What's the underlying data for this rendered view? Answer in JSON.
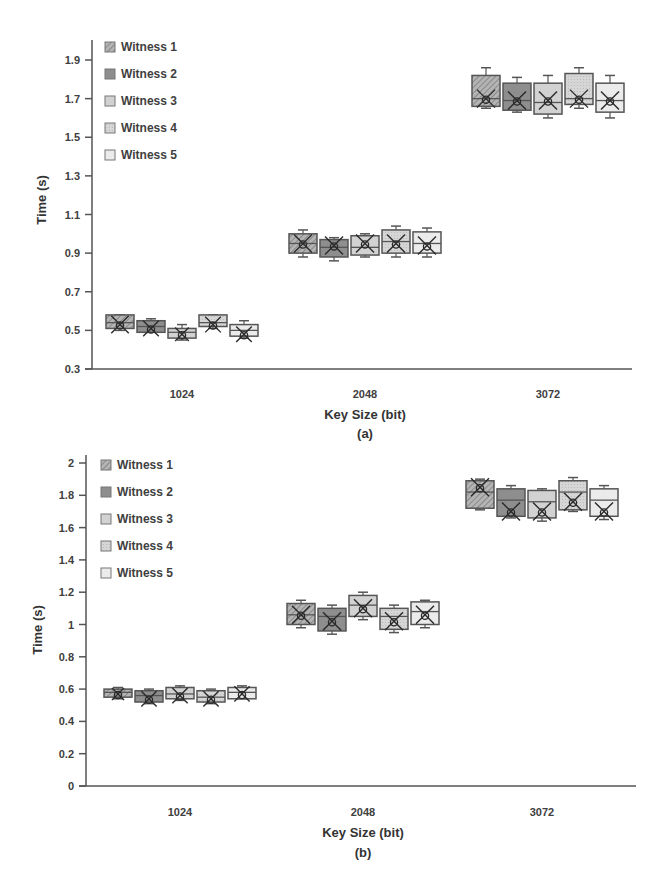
{
  "chart_data": [
    {
      "id": "a",
      "type": "box",
      "caption": "(a)",
      "xlabel": "Key Size (bit)",
      "ylabel": "Time (s)",
      "ylim": [
        0.3,
        1.95
      ],
      "yticks": [
        0.3,
        0.5,
        0.7,
        0.9,
        1.1,
        1.3,
        1.5,
        1.7,
        1.9
      ],
      "ytick_labels": [
        "0.3",
        "0.5",
        "0.7",
        "0.9",
        "1.1",
        "1.3",
        "1.5",
        "1.7",
        "1.9"
      ],
      "categories": [
        "1024",
        "2048",
        "3072"
      ],
      "legend_position": "top-left",
      "grid": false,
      "series": [
        {
          "name": "Witness 1",
          "color": "#a9a9a9",
          "pattern": "hatch",
          "boxes": [
            {
              "min": 0.5,
              "q1": 0.51,
              "median": 0.54,
              "q3": 0.58,
              "max": 0.58,
              "mean": 0.53
            },
            {
              "min": 0.88,
              "q1": 0.9,
              "median": 0.95,
              "q3": 1.0,
              "max": 1.02,
              "mean": 0.95
            },
            {
              "min": 1.65,
              "q1": 1.66,
              "median": 1.7,
              "q3": 1.82,
              "max": 1.86,
              "mean": 1.7
            }
          ]
        },
        {
          "name": "Witness 2",
          "color": "#8e8e8e",
          "pattern": "solid",
          "boxes": [
            {
              "min": 0.49,
              "q1": 0.49,
              "median": 0.52,
              "q3": 0.55,
              "max": 0.56,
              "mean": 0.51
            },
            {
              "min": 0.86,
              "q1": 0.88,
              "median": 0.93,
              "q3": 0.97,
              "max": 0.98,
              "mean": 0.94
            },
            {
              "min": 1.63,
              "q1": 1.64,
              "median": 1.69,
              "q3": 1.78,
              "max": 1.81,
              "mean": 1.69
            }
          ]
        },
        {
          "name": "Witness 3",
          "color": "#d2d2d2",
          "pattern": "solid",
          "boxes": [
            {
              "min": 0.45,
              "q1": 0.46,
              "median": 0.49,
              "q3": 0.51,
              "max": 0.53,
              "mean": 0.48
            },
            {
              "min": 0.88,
              "q1": 0.89,
              "median": 0.93,
              "q3": 0.99,
              "max": 1.0,
              "mean": 0.95
            },
            {
              "min": 1.6,
              "q1": 1.62,
              "median": 1.68,
              "q3": 1.78,
              "max": 1.82,
              "mean": 1.69
            }
          ]
        },
        {
          "name": "Witness 4",
          "color": "#d9d9d9",
          "pattern": "dots",
          "boxes": [
            {
              "min": 0.51,
              "q1": 0.52,
              "median": 0.54,
              "q3": 0.58,
              "max": 0.58,
              "mean": 0.53
            },
            {
              "min": 0.88,
              "q1": 0.9,
              "median": 0.96,
              "q3": 1.02,
              "max": 1.04,
              "mean": 0.95
            },
            {
              "min": 1.65,
              "q1": 1.67,
              "median": 1.7,
              "q3": 1.83,
              "max": 1.86,
              "mean": 1.7
            }
          ]
        },
        {
          "name": "Witness 5",
          "color": "#ebebeb",
          "pattern": "solid",
          "boxes": [
            {
              "min": 0.46,
              "q1": 0.47,
              "median": 0.5,
              "q3": 0.53,
              "max": 0.55,
              "mean": 0.48
            },
            {
              "min": 0.88,
              "q1": 0.9,
              "median": 0.95,
              "q3": 1.01,
              "max": 1.03,
              "mean": 0.94
            },
            {
              "min": 1.6,
              "q1": 1.63,
              "median": 1.69,
              "q3": 1.78,
              "max": 1.82,
              "mean": 1.69
            }
          ]
        }
      ]
    },
    {
      "id": "b",
      "type": "box",
      "caption": "(b)",
      "xlabel": "Key Size (bit)",
      "ylabel": "Time (s)",
      "ylim": [
        0,
        2
      ],
      "yticks": [
        0,
        0.2,
        0.4,
        0.6,
        0.8,
        1,
        1.2,
        1.4,
        1.6,
        1.8,
        2
      ],
      "ytick_labels": [
        "0",
        "0.2",
        "0.4",
        "0.6",
        "0.8",
        "1",
        "1.2",
        "1.4",
        "1.6",
        "1.8",
        "2"
      ],
      "categories": [
        "1024",
        "2048",
        "3072"
      ],
      "legend_position": "top-left",
      "grid": false,
      "series": [
        {
          "name": "Witness 1",
          "color": "#a9a9a9",
          "pattern": "hatch",
          "boxes": [
            {
              "min": 0.54,
              "q1": 0.55,
              "median": 0.58,
              "q3": 0.6,
              "max": 0.61,
              "mean": 0.57
            },
            {
              "min": 0.98,
              "q1": 1.0,
              "median": 1.06,
              "q3": 1.13,
              "max": 1.15,
              "mean": 1.06
            },
            {
              "min": 1.71,
              "q1": 1.72,
              "median": 1.82,
              "q3": 1.89,
              "max": 1.9,
              "mean": 1.85
            }
          ]
        },
        {
          "name": "Witness 2",
          "color": "#8e8e8e",
          "pattern": "solid",
          "boxes": [
            {
              "min": 0.51,
              "q1": 0.52,
              "median": 0.56,
              "q3": 0.59,
              "max": 0.6,
              "mean": 0.54
            },
            {
              "min": 0.94,
              "q1": 0.96,
              "median": 1.05,
              "q3": 1.1,
              "max": 1.12,
              "mean": 1.02
            },
            {
              "min": 1.66,
              "q1": 1.67,
              "median": 1.77,
              "q3": 1.84,
              "max": 1.86,
              "mean": 1.7
            }
          ]
        },
        {
          "name": "Witness 3",
          "color": "#d2d2d2",
          "pattern": "solid",
          "boxes": [
            {
              "min": 0.53,
              "q1": 0.54,
              "median": 0.57,
              "q3": 0.61,
              "max": 0.62,
              "mean": 0.56
            },
            {
              "min": 1.03,
              "q1": 1.05,
              "median": 1.12,
              "q3": 1.18,
              "max": 1.2,
              "mean": 1.1
            },
            {
              "min": 1.64,
              "q1": 1.66,
              "median": 1.76,
              "q3": 1.83,
              "max": 1.84,
              "mean": 1.7
            }
          ]
        },
        {
          "name": "Witness 4",
          "color": "#d9d9d9",
          "pattern": "dots",
          "boxes": [
            {
              "min": 0.51,
              "q1": 0.52,
              "median": 0.55,
              "q3": 0.59,
              "max": 0.6,
              "mean": 0.54
            },
            {
              "min": 0.95,
              "q1": 0.97,
              "median": 1.05,
              "q3": 1.1,
              "max": 1.12,
              "mean": 1.02
            },
            {
              "min": 1.7,
              "q1": 1.71,
              "median": 1.82,
              "q3": 1.89,
              "max": 1.91,
              "mean": 1.76
            }
          ]
        },
        {
          "name": "Witness 5",
          "color": "#ebebeb",
          "pattern": "solid",
          "boxes": [
            {
              "min": 0.54,
              "q1": 0.54,
              "median": 0.58,
              "q3": 0.61,
              "max": 0.62,
              "mean": 0.57
            },
            {
              "min": 0.98,
              "q1": 1.0,
              "median": 1.08,
              "q3": 1.14,
              "max": 1.15,
              "mean": 1.06
            },
            {
              "min": 1.65,
              "q1": 1.67,
              "median": 1.77,
              "q3": 1.84,
              "max": 1.86,
              "mean": 1.7
            }
          ]
        }
      ]
    }
  ],
  "layout": [
    {
      "x0": 92,
      "x1": 632,
      "yTop": 40,
      "yBottom": 369,
      "groupCenters": [
        182,
        365,
        548
      ],
      "boxW": 28,
      "boxGap": 31
    },
    {
      "x0": 86,
      "x1": 636,
      "yTop": 455,
      "yBottom": 786,
      "groupCenters": [
        180,
        363,
        542
      ],
      "boxW": 28,
      "boxGap": 31
    }
  ],
  "axis_color": "#555555",
  "box_stroke": "#555555",
  "marker_color": "#2a2a2a"
}
